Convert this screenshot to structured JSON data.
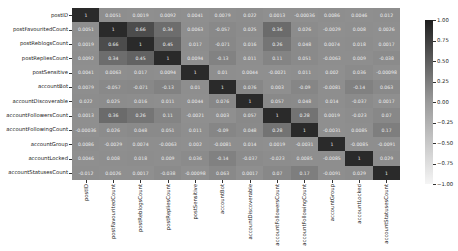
{
  "chart_data": {
    "type": "heatmap",
    "title": "",
    "xlabel": "",
    "ylabel": "",
    "labels": [
      "postID",
      "postFavouritedCount",
      "postReblogsCount",
      "postRepliesCount",
      "postSensitive",
      "accountBot",
      "accountDiscoverable",
      "accountFollowersCount",
      "accountFollowingCount",
      "accountGroup",
      "accountLocked",
      "accountStatusesCount"
    ],
    "rows": [
      "postID",
      "postFavouritedCount",
      "postReblogsCount",
      "postRepliesCount",
      "postSensitive",
      "accountBot",
      "accountDiscoverable",
      "accountFollowersCount",
      "accountFollowingCount",
      "accountGroup",
      "accountLocked",
      "accountStatusesCount"
    ],
    "matrix": [
      [
        1,
        0.0051,
        0.0019,
        0.0092,
        0.0041,
        0.0079,
        0.022,
        0.0013,
        0.00036,
        0.0086,
        0.0046,
        0.012
      ],
      [
        0.0051,
        1,
        0.66,
        0.34,
        0.0063,
        0.057,
        0.025,
        0.36,
        0.026,
        0.0029,
        0.008,
        0.0026
      ],
      [
        0.0019,
        0.66,
        1,
        0.45,
        0.017,
        0.071,
        0.016,
        0.26,
        0.048,
        0.0074,
        0.018,
        0.0017
      ],
      [
        0.0092,
        0.34,
        0.45,
        1,
        0.0094,
        0.13,
        0.011,
        0.11,
        0.051,
        0.0063,
        0.009,
        0.038
      ],
      [
        0.0041,
        0.0063,
        0.017,
        0.0094,
        1,
        0.01,
        0.0044,
        0.0021,
        0.011,
        0.002,
        0.036,
        0.00098
      ],
      [
        0.0079,
        0.057,
        0.071,
        0.13,
        0.01,
        1,
        0.076,
        0.003,
        0.09,
        0.0081,
        0.14,
        0.063
      ],
      [
        0.022,
        0.025,
        0.016,
        0.011,
        0.0044,
        0.076,
        1,
        0.057,
        0.048,
        0.014,
        0.037,
        0.0017
      ],
      [
        0.0013,
        0.36,
        0.26,
        0.11,
        0.0021,
        0.003,
        0.057,
        1,
        0.28,
        0.0019,
        0.023,
        0.07
      ],
      [
        0.00036,
        0.026,
        0.048,
        0.051,
        0.011,
        0.09,
        0.048,
        0.28,
        1,
        0.0031,
        0.0085,
        0.17
      ],
      [
        0.0086,
        0.0029,
        0.0074,
        0.0063,
        0.002,
        0.0081,
        0.014,
        0.0019,
        0.0031,
        1,
        0.0085,
        0.0091
      ],
      [
        0.0046,
        0.008,
        0.018,
        0.009,
        0.036,
        0.14,
        0.037,
        0.023,
        0.0085,
        0.0085,
        1,
        0.029
      ],
      [
        0.012,
        0.0026,
        0.0017,
        0.038,
        0.00098,
        0.063,
        0.0017,
        0.07,
        0.17,
        0.0091,
        0.029,
        1
      ]
    ],
    "display_text": [
      [
        "1",
        "0.0051",
        "0.0019",
        "0.0092",
        "0.0041",
        "0.0079",
        "0.022",
        "0.0013",
        "-0.00036",
        "0.0086",
        "0.0046",
        "0.012"
      ],
      [
        "0.0051",
        "1",
        "0.66",
        "0.34",
        "0.0063",
        "-0.057",
        "0.025",
        "0.36",
        "0.026",
        "-0.0029",
        "0.008",
        "0.0026"
      ],
      [
        "0.0019",
        "0.66",
        "1",
        "0.45",
        "0.017",
        "-0.071",
        "0.016",
        "0.26",
        "0.048",
        "0.0074",
        "0.018",
        "0.0017"
      ],
      [
        "0.0092",
        "0.34",
        "0.45",
        "1",
        "0.0094",
        "-0.13",
        "0.011",
        "0.11",
        "0.051",
        "-0.0063",
        "0.009",
        "-0.038"
      ],
      [
        "0.0041",
        "0.0063",
        "0.017",
        "0.0094",
        "1",
        "0.01",
        "0.0044",
        "-0.0021",
        "0.011",
        "0.002",
        "0.036",
        "-0.00098"
      ],
      [
        "0.0079",
        "-0.057",
        "-0.071",
        "-0.13",
        "0.01",
        "1",
        "0.076",
        "0.003",
        "-0.09",
        "-0.0081",
        "-0.14",
        "0.063"
      ],
      [
        "0.022",
        "0.025",
        "0.016",
        "0.011",
        "0.0044",
        "0.076",
        "1",
        "0.057",
        "0.048",
        "0.014",
        "-0.037",
        "0.0017"
      ],
      [
        "0.0013",
        "0.36",
        "0.26",
        "0.11",
        "-0.0021",
        "0.003",
        "0.057",
        "1",
        "0.28",
        "0.0019",
        "-0.023",
        "0.07"
      ],
      [
        "-0.00036",
        "0.026",
        "0.048",
        "0.051",
        "0.011",
        "-0.09",
        "0.048",
        "0.28",
        "1",
        "-0.0031",
        "0.0085",
        "0.17"
      ],
      [
        "0.0086",
        "-0.0029",
        "0.0074",
        "-0.0063",
        "0.002",
        "-0.0081",
        "0.014",
        "0.0019",
        "-0.0031",
        "1",
        "-0.0085",
        "-0.0091"
      ],
      [
        "0.0046",
        "0.008",
        "0.018",
        "0.009",
        "0.036",
        "-0.14",
        "-0.037",
        "-0.023",
        "0.0085",
        "-0.0085",
        "1",
        "0.029"
      ],
      [
        "-0.012",
        "0.0026",
        "0.0017",
        "-0.038",
        "-0.00098",
        "0.063",
        "0.0017",
        "0.07",
        "0.17",
        "-0.0091",
        "0.029",
        "1"
      ]
    ],
    "colorbar": {
      "ticks": [
        "1.00",
        "0.75",
        "0.50",
        "0.25",
        "0.00",
        "−0.25",
        "−0.50",
        "−0.75",
        "−1.00"
      ],
      "vmin": -1,
      "vmax": 1
    },
    "colors": {
      "low": "#f2f2f2",
      "mid": "#8f8f8f",
      "high": "#2a2a2a"
    }
  }
}
